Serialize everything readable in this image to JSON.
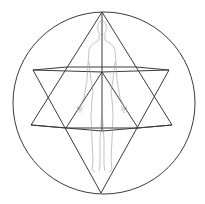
{
  "diagram": {
    "title": "Star tetrahedron with human figure in circle",
    "colors": {
      "background": "#ffffff",
      "geometry_stroke": "#3a3a3a",
      "figure_stroke": "#9a9a9a"
    },
    "circle": {
      "cx": 104,
      "cy": 103,
      "r": 91
    },
    "points": {
      "top_apex": [
        102,
        12
      ],
      "bottom_apex": [
        101,
        193
      ],
      "upper_left": [
        33,
        70
      ],
      "upper_center": [
        102,
        72
      ],
      "upper_right": [
        169,
        70
      ],
      "lower_left": [
        31,
        125
      ],
      "lower_center": [
        102,
        131
      ],
      "lower_right": [
        172,
        125
      ],
      "upper_inner_left": [
        67,
        67
      ],
      "upper_inner_right": [
        136,
        67
      ],
      "lower_inner_left": [
        66,
        128
      ],
      "lower_inner_right": [
        138,
        128
      ]
    }
  }
}
